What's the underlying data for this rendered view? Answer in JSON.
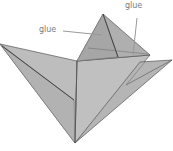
{
  "diagram": {
    "labels": [
      {
        "id": "glue-left",
        "text": "glue"
      },
      {
        "id": "glue-top-right",
        "text": "glue"
      }
    ],
    "colors": {
      "paper": "#b9b9b9",
      "paper_light": "#c8c8c8",
      "paper_dark": "#a9a9a9",
      "edge": "#555555",
      "label": "#7a7a7a",
      "leader": "#9a9a9a"
    }
  }
}
